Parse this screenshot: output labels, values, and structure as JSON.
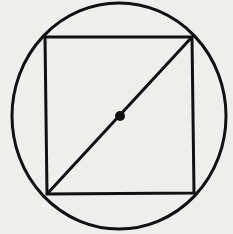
{
  "diagram": {
    "title": "",
    "background": "#eeeeec",
    "stroke_color": "#111111",
    "shapes": {
      "circle": {
        "cx": 119,
        "cy": 116,
        "rx": 107,
        "ry": 113,
        "stroke_width": 3
      },
      "square": {
        "corners": [
          [
            45,
            37
          ],
          [
            192,
            37
          ],
          [
            194,
            193
          ],
          [
            47,
            194
          ]
        ],
        "stroke_width": 3
      },
      "diagonal": {
        "x1": 47,
        "y1": 194,
        "x2": 192,
        "y2": 37,
        "stroke_width": 3
      },
      "center_point": {
        "cx": 120,
        "cy": 116,
        "r": 5
      }
    },
    "labels": []
  }
}
